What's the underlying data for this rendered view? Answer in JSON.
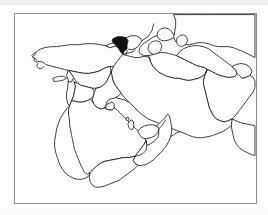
{
  "document": {
    "type": "outline-map",
    "title": "Middle East and West Asia outline map",
    "background_color": "#ffffff",
    "frame_color": "#8c8c8c",
    "outline_color": "#1a1a1a",
    "highlight_color": "#111111",
    "fill_color": "#ffffff"
  },
  "map": {
    "region": "Middle East / West Asia",
    "projection_note": "unlabeled outline map, no graticule, no place labels",
    "labels_visible": false,
    "legend_visible": false,
    "highlighted_country": "Armenia",
    "countries": [
      {
        "name": "Turkey",
        "highlighted": false
      },
      {
        "name": "Georgia",
        "highlighted": false
      },
      {
        "name": "Armenia",
        "highlighted": true
      },
      {
        "name": "Azerbaijan",
        "highlighted": false
      },
      {
        "name": "Syria",
        "highlighted": false
      },
      {
        "name": "Lebanon",
        "highlighted": false
      },
      {
        "name": "Israel",
        "highlighted": false
      },
      {
        "name": "Jordan",
        "highlighted": false
      },
      {
        "name": "Iraq",
        "highlighted": false
      },
      {
        "name": "Iran",
        "highlighted": false
      },
      {
        "name": "Kuwait",
        "highlighted": false
      },
      {
        "name": "Saudi Arabia",
        "highlighted": false
      },
      {
        "name": "Qatar",
        "highlighted": false
      },
      {
        "name": "United Arab Emirates",
        "highlighted": false
      },
      {
        "name": "Oman",
        "highlighted": false
      },
      {
        "name": "Yemen",
        "highlighted": false
      },
      {
        "name": "Turkmenistan",
        "highlighted": false
      },
      {
        "name": "Uzbekistan",
        "highlighted": false
      },
      {
        "name": "Kazakhstan",
        "highlighted": false
      },
      {
        "name": "Afghanistan",
        "highlighted": false
      },
      {
        "name": "Tajikistan",
        "highlighted": false
      },
      {
        "name": "Pakistan",
        "highlighted": false
      },
      {
        "name": "Cyprus",
        "highlighted": false
      }
    ]
  }
}
